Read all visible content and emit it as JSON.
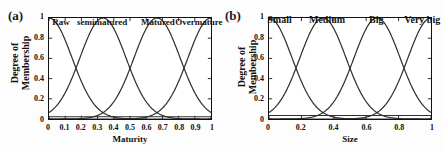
{
  "figure": {
    "background": "#ffffff",
    "curve_color": "#303030",
    "axis_color": "#111111"
  },
  "panels": [
    {
      "tag": "(a)",
      "ylabel_line1": "Degree of",
      "ylabel_line2": "Membership"
    },
    {
      "tag": "(b)",
      "ylabel_line1": "Degree of",
      "ylabel_line2": "Membership"
    }
  ],
  "chart_data": [
    {
      "type": "line",
      "title": "(a)",
      "xlabel": "Maturity",
      "ylabel": "Degree of Membership",
      "xlim": [
        0,
        1
      ],
      "ylim": [
        0,
        1
      ],
      "grid": false,
      "legend_position": "inside-top",
      "xticks": [
        "0",
        "0.1",
        "0.2",
        "0.3",
        "0.4",
        "0.5",
        "0.6",
        "0.7",
        "0.8",
        "0.9",
        "1"
      ],
      "xtick_values": [
        0,
        0.1,
        0.2,
        0.3,
        0.4,
        0.5,
        0.6,
        0.7,
        0.8,
        0.9,
        1
      ],
      "yticks": [
        "0",
        "0.2",
        "0.4",
        "0.6",
        "0.8",
        "1"
      ],
      "ytick_values": [
        0,
        0.2,
        0.4,
        0.6,
        0.8,
        1
      ],
      "baseline_y": 0.022,
      "annotations": [
        {
          "text": "Raw",
          "x": 0.08
        },
        {
          "text": "semimatured",
          "x": 0.33
        },
        {
          "text": "Matured",
          "x": 0.67
        },
        {
          "text": "Overmature",
          "x": 0.92
        }
      ],
      "series": [
        {
          "name": "Raw",
          "center": 0.0,
          "sigma": 0.142,
          "peak": 1.0
        },
        {
          "name": "semimatured",
          "center": 0.333,
          "sigma": 0.142,
          "peak": 1.0
        },
        {
          "name": "Matured",
          "center": 0.667,
          "sigma": 0.142,
          "peak": 1.0
        },
        {
          "name": "Overmature",
          "center": 1.0,
          "sigma": 0.142,
          "peak": 1.0
        }
      ]
    },
    {
      "type": "line",
      "title": "(b)",
      "xlabel": "Size",
      "ylabel": "Degree of Membership",
      "xlim": [
        0,
        1
      ],
      "ylim": [
        0,
        1
      ],
      "grid": false,
      "legend_position": "inside-top",
      "xticks": [
        "0",
        "0.2",
        "0.4",
        "0.6",
        "0.8",
        "1"
      ],
      "xtick_values": [
        0,
        0.2,
        0.4,
        0.6,
        0.8,
        1
      ],
      "yticks": [
        "0",
        "0.2",
        "0.4",
        "0.6",
        "0.8",
        "1"
      ],
      "ytick_values": [
        0,
        0.2,
        0.4,
        0.6,
        0.8,
        1
      ],
      "baseline_y": 0.035,
      "annotations": [
        {
          "text": "Small",
          "x": 0.07
        },
        {
          "text": "Medium",
          "x": 0.36
        },
        {
          "text": "Big",
          "x": 0.66
        },
        {
          "text": "Very big",
          "x": 0.94
        }
      ],
      "series": [
        {
          "name": "Small",
          "center": 0.0,
          "sigma": 0.142,
          "peak": 1.0
        },
        {
          "name": "Medium",
          "center": 0.333,
          "sigma": 0.142,
          "peak": 1.0
        },
        {
          "name": "Big",
          "center": 0.667,
          "sigma": 0.142,
          "peak": 1.0
        },
        {
          "name": "Very big",
          "center": 1.0,
          "sigma": 0.142,
          "peak": 1.0
        }
      ]
    }
  ]
}
